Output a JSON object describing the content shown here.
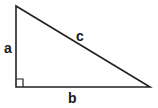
{
  "diagram": {
    "type": "right-triangle",
    "stroke_color": "#222222",
    "labels": {
      "a": "a",
      "b": "b",
      "c": "c"
    },
    "vertices": {
      "top": [
        16,
        6
      ],
      "right_angle": [
        16,
        87
      ],
      "right": [
        150,
        86
      ]
    },
    "right_angle_marker": true
  }
}
